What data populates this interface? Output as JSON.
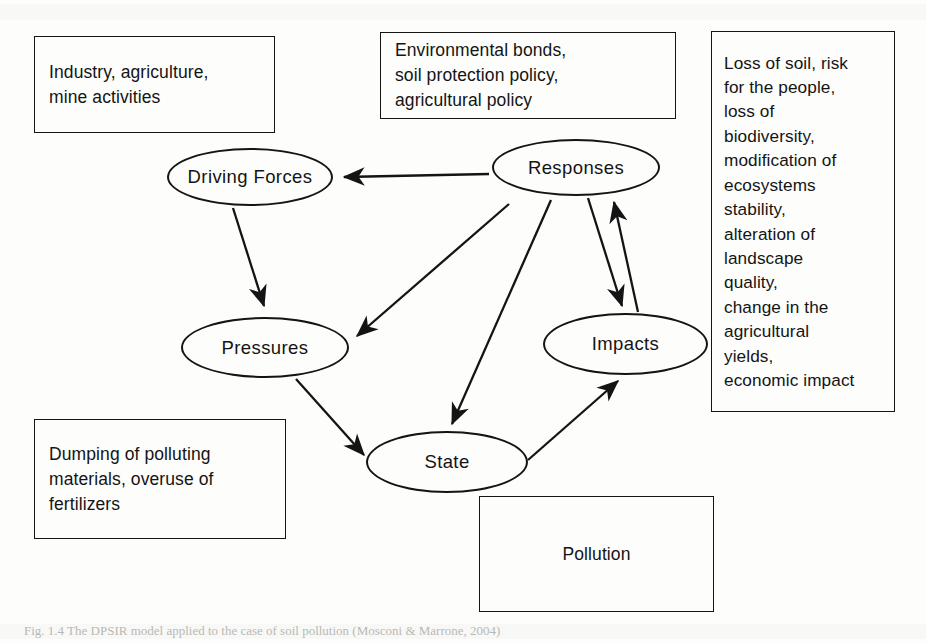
{
  "figure": {
    "caption": "Fig. 1.4  The DPSIR model applied to the case of soil pollution (Mosconi & Marrone, 2004)",
    "nodes": [
      {
        "id": "driving-forces",
        "label": "Driving Forces"
      },
      {
        "id": "pressures",
        "label": "Pressures"
      },
      {
        "id": "state",
        "label": "State"
      },
      {
        "id": "impacts",
        "label": "Impacts"
      },
      {
        "id": "responses",
        "label": "Responses"
      }
    ],
    "notes": [
      {
        "id": "driving",
        "attached_to": "Driving Forces",
        "text": "Industry, agriculture,\nmine activities"
      },
      {
        "id": "response",
        "attached_to": "Responses",
        "text": "Environmental bonds,\nsoil protection policy,\nagricultural policy"
      },
      {
        "id": "impact",
        "attached_to": "Impacts",
        "text": "Loss of soil, risk\nfor the people,\nloss of\nbiodiversity,\nmodification of\necosystems\nstability,\nalteration of\nlandscape\nquality,\nchange in the\nagricultural\nyields,\neconomic impact"
      },
      {
        "id": "pressure",
        "attached_to": "Pressures",
        "text": "Dumping of polluting\nmaterials, overuse of\nfertilizers"
      },
      {
        "id": "pollution",
        "attached_to": "State",
        "text": "Pollution"
      }
    ],
    "edges": [
      {
        "from": "Responses",
        "to": "Driving Forces"
      },
      {
        "from": "Driving Forces",
        "to": "Pressures"
      },
      {
        "from": "Responses",
        "to": "Pressures"
      },
      {
        "from": "Pressures",
        "to": "State"
      },
      {
        "from": "Responses",
        "to": "State"
      },
      {
        "from": "State",
        "to": "Impacts"
      },
      {
        "from": "Responses",
        "to": "Impacts"
      },
      {
        "from": "Impacts",
        "to": "Responses"
      }
    ],
    "colors": {
      "ink": "#141414",
      "page": "#fdfdfc",
      "caption": "#b9b9b4"
    }
  }
}
